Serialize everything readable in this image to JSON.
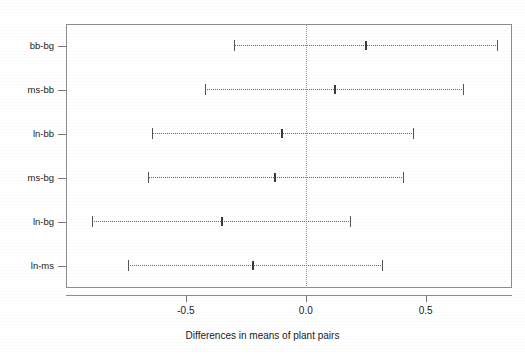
{
  "chart_data": {
    "type": "scatter",
    "title": "",
    "subtitle": "",
    "xlabel": "Differences in means of plant pairs",
    "ylabel": "",
    "xlim": [
      -1.0,
      0.86
    ],
    "ylim": [
      0,
      6
    ],
    "grid": false,
    "legend": null,
    "zero_reference_line": 0.0,
    "x_ticks": [
      -0.5,
      0.0,
      0.5
    ],
    "x_tick_labels": [
      "-0.5",
      "0.0",
      "0.5"
    ],
    "categories": [
      "bb-bg",
      "ms-bb",
      "ln-bb",
      "ms-bg",
      "ln-bg",
      "ln-ms"
    ],
    "series": [
      {
        "name": "Tukey HSD 95% family-wise confidence intervals",
        "points": [
          {
            "category": "bb-bg",
            "diff": 0.25,
            "lwr": -0.3,
            "upr": 0.8
          },
          {
            "category": "ms-bb",
            "diff": 0.12,
            "lwr": -0.42,
            "upr": 0.66
          },
          {
            "category": "ln-bb",
            "diff": -0.1,
            "lwr": -0.64,
            "upr": 0.45
          },
          {
            "category": "ms-bg",
            "diff": -0.13,
            "lwr": -0.66,
            "upr": 0.41
          },
          {
            "category": "ln-bg",
            "diff": -0.35,
            "lwr": -0.89,
            "upr": 0.19
          },
          {
            "category": "ln-ms",
            "diff": -0.22,
            "lwr": -0.74,
            "upr": 0.32
          }
        ]
      }
    ],
    "colors": {
      "frame": "#8d8d8d",
      "interval": "#6a6a6a",
      "center": "#3a3a3a",
      "zero_line": "#9a9a9a",
      "text": "#1a1a1a",
      "background": "#ffffff"
    }
  }
}
